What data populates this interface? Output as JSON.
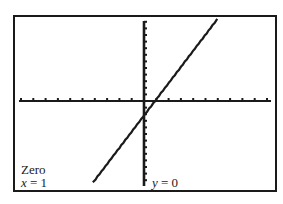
{
  "chart_data": {
    "type": "line",
    "title": "",
    "xlabel": "",
    "ylabel": "",
    "xlim": [
      -10,
      10
    ],
    "ylim": [
      -12.5,
      12.5
    ],
    "xscl": 1,
    "yscl": 1,
    "grid": false,
    "axes_ticks": true,
    "series": [
      {
        "name": "Y1",
        "x": [
          -4.1,
          1,
          5.9
        ],
        "y": [
          -12.2,
          0,
          12.3
        ]
      }
    ],
    "annotations": [
      {
        "text": "Zero",
        "position": "bottom-left"
      },
      {
        "text": "x = 1",
        "position": "bottom-left"
      },
      {
        "text": "y = 0",
        "position": "bottom-center"
      }
    ]
  },
  "screen": {
    "feature_label": "Zero",
    "x_label_var": "x",
    "x_label_eq": " = 1",
    "y_label_var": "y",
    "y_label_eq": " = 0",
    "colors": {
      "frame": "#1a1a1a",
      "axes": "#1a1a1a",
      "plot_line": "#1a1a1a",
      "background": "#ffffff"
    }
  }
}
